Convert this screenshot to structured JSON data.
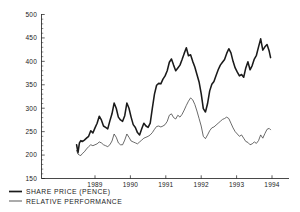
{
  "chart_data": {
    "type": "line",
    "title": "",
    "subtitle": "",
    "xlabel": "",
    "ylabel": "",
    "xlim": [
      1988.45,
      1994.0
    ],
    "ylim": [
      150,
      500
    ],
    "grid": false,
    "legend_position": "below-left",
    "y_ticks": [
      150,
      200,
      250,
      300,
      350,
      400,
      450,
      500
    ],
    "y_tick_labels": [
      "150",
      "200",
      "250",
      "300",
      "350",
      "400",
      "450",
      "500"
    ],
    "x_ticks": [
      1989,
      1990,
      1991,
      1992,
      1993,
      1994
    ],
    "x_tick_labels": [
      "1989",
      "1990",
      "1991",
      "1992",
      "1993",
      "1994"
    ],
    "series": [
      {
        "name": "SHARE  PRICE  (PENCE)",
        "style": "thick",
        "color": "#1a1a1a",
        "x": [
          1988.48,
          1988.52,
          1988.56,
          1988.6,
          1988.64,
          1988.7,
          1988.76,
          1988.82,
          1988.88,
          1988.94,
          1989.0,
          1989.06,
          1989.12,
          1989.18,
          1989.24,
          1989.3,
          1989.36,
          1989.42,
          1989.48,
          1989.54,
          1989.6,
          1989.66,
          1989.72,
          1989.78,
          1989.84,
          1989.9,
          1989.96,
          1990.02,
          1990.08,
          1990.14,
          1990.2,
          1990.26,
          1990.32,
          1990.38,
          1990.44,
          1990.5,
          1990.56,
          1990.62,
          1990.68,
          1990.74,
          1990.8,
          1990.86,
          1990.92,
          1990.98,
          1991.04,
          1991.1,
          1991.16,
          1991.22,
          1991.28,
          1991.34,
          1991.4,
          1991.46,
          1991.52,
          1991.58,
          1991.64,
          1991.7,
          1991.76,
          1991.82,
          1991.88,
          1991.94,
          1992.0,
          1992.06,
          1992.12,
          1992.18,
          1992.24,
          1992.3,
          1992.36,
          1992.42,
          1992.48,
          1992.54,
          1992.6,
          1992.66,
          1992.72,
          1992.78,
          1992.84,
          1992.9,
          1992.96,
          1993.02,
          1993.08,
          1993.14,
          1993.2,
          1993.26,
          1993.32,
          1993.38,
          1993.44,
          1993.5,
          1993.56,
          1993.62,
          1993.68,
          1993.74,
          1993.8,
          1993.86,
          1993.92,
          1993.96
        ],
        "values": [
          222,
          205,
          226,
          231,
          229,
          232,
          236,
          240,
          252,
          247,
          258,
          268,
          283,
          275,
          262,
          259,
          256,
          273,
          288,
          311,
          300,
          281,
          275,
          272,
          284,
          311,
          300,
          281,
          265,
          259,
          248,
          243,
          256,
          268,
          262,
          259,
          268,
          300,
          330,
          349,
          353,
          352,
          362,
          369,
          380,
          398,
          405,
          392,
          380,
          386,
          392,
          404,
          417,
          429,
          412,
          414,
          400,
          388,
          372,
          356,
          331,
          299,
          292,
          310,
          337,
          351,
          357,
          370,
          382,
          392,
          398,
          404,
          417,
          427,
          418,
          400,
          386,
          377,
          369,
          372,
          366,
          386,
          399,
          382,
          391,
          405,
          413,
          431,
          448,
          424,
          431,
          436,
          422,
          408
        ]
      },
      {
        "name": "RELATIVE  PERFORMANCE",
        "style": "thin",
        "color": "#3a3a3a",
        "x": [
          1988.48,
          1988.52,
          1988.56,
          1988.6,
          1988.64,
          1988.7,
          1988.76,
          1988.82,
          1988.88,
          1988.94,
          1989.0,
          1989.06,
          1989.12,
          1989.18,
          1989.24,
          1989.3,
          1989.36,
          1989.42,
          1989.48,
          1989.54,
          1989.6,
          1989.66,
          1989.72,
          1989.78,
          1989.84,
          1989.9,
          1989.96,
          1990.02,
          1990.08,
          1990.14,
          1990.2,
          1990.26,
          1990.32,
          1990.38,
          1990.44,
          1990.5,
          1990.56,
          1990.62,
          1990.68,
          1990.74,
          1990.8,
          1990.86,
          1990.92,
          1990.98,
          1991.04,
          1991.1,
          1991.16,
          1991.22,
          1991.28,
          1991.34,
          1991.4,
          1991.46,
          1991.52,
          1991.58,
          1991.64,
          1991.7,
          1991.76,
          1991.82,
          1991.88,
          1991.94,
          1992.0,
          1992.06,
          1992.12,
          1992.18,
          1992.24,
          1992.3,
          1992.36,
          1992.42,
          1992.48,
          1992.54,
          1992.6,
          1992.66,
          1992.72,
          1992.78,
          1992.84,
          1992.9,
          1992.96,
          1993.02,
          1993.08,
          1993.14,
          1993.2,
          1993.26,
          1993.32,
          1993.38,
          1993.44,
          1993.5,
          1993.56,
          1993.62,
          1993.68,
          1993.74,
          1993.8,
          1993.86,
          1993.92,
          1993.96
        ],
        "values": [
          210,
          202,
          200,
          199,
          203,
          207,
          213,
          218,
          222,
          220,
          222,
          224,
          228,
          226,
          222,
          220,
          218,
          222,
          230,
          245,
          238,
          226,
          222,
          222,
          232,
          245,
          238,
          230,
          228,
          226,
          224,
          228,
          232,
          236,
          238,
          240,
          243,
          248,
          255,
          261,
          262,
          260,
          262,
          265,
          272,
          285,
          288,
          280,
          277,
          285,
          281,
          287,
          296,
          306,
          315,
          322,
          318,
          308,
          294,
          278,
          262,
          240,
          235,
          243,
          252,
          258,
          260,
          264,
          268,
          272,
          276,
          278,
          281,
          278,
          268,
          258,
          250,
          245,
          240,
          243,
          236,
          229,
          227,
          222,
          224,
          228,
          225,
          231,
          243,
          236,
          246,
          255,
          257,
          254
        ]
      }
    ],
    "legend": [
      {
        "label": "SHARE  PRICE  (PENCE)",
        "style": "thick"
      },
      {
        "label": "RELATIVE  PERFORMANCE",
        "style": "thin"
      }
    ]
  },
  "colors": {
    "background": "#ffffff",
    "axis": "#1a1a1a",
    "series_thick": "#1a1a1a",
    "series_thin": "#3a3a3a"
  }
}
